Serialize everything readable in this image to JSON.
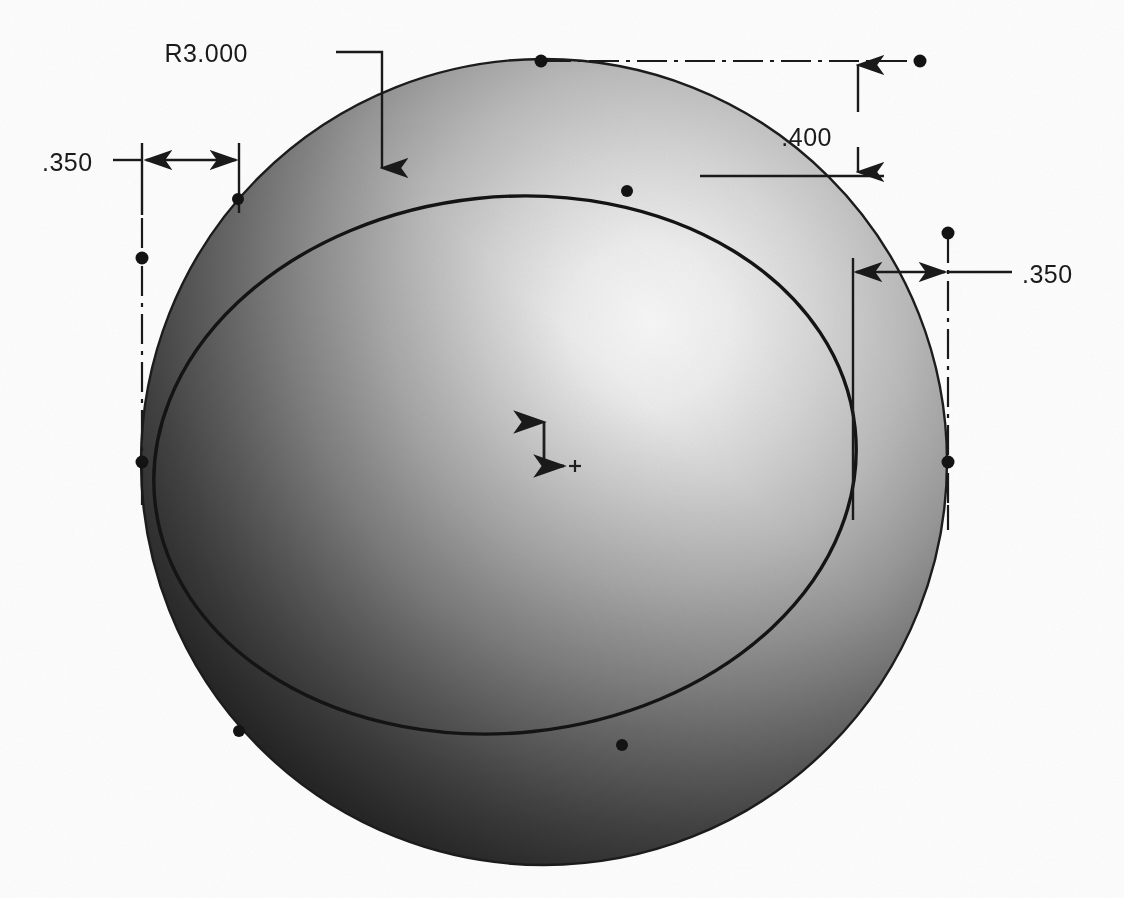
{
  "drawing": {
    "title": "Sphere with Revolved Cut - Dimensioned View",
    "type": "engineering-drawing",
    "background_color": "#fdfdfd",
    "line_color": "#1a1a1a",
    "canvas": {
      "width": 1124,
      "height": 898
    }
  },
  "sphere": {
    "name": "shaded-sphere",
    "center_x": 544,
    "center_y": 462,
    "radius": 403,
    "highlight_x_pct": 63,
    "highlight_y_pct": 33,
    "highlight_color": "#fbfbfb",
    "midtone_color": "#9a9a9a",
    "shadow_color": "#2a2a2a",
    "edge_color": "#222222"
  },
  "inner_curve": {
    "name": "revolved-cut-edge",
    "description": "offset circular edge of revolved cut",
    "center_x": 505,
    "center_y": 465,
    "radius": 352,
    "rotation_deg": -6
  },
  "dimensions": [
    {
      "id": "radius-callout",
      "name": "dimension-r3000",
      "label": "R3.000",
      "kind": "radius-leader",
      "text_x": 248,
      "text_y": 62,
      "leader_start_x": 336,
      "leader_elbow_x": 382,
      "leader_y": 52,
      "arrow_tip_x": 382,
      "arrow_tip_y": 176
    },
    {
      "id": "left-offset",
      "name": "dimension-left-350",
      "label": ".350",
      "value": 0.35,
      "kind": "linear-horizontal",
      "text_x": 42,
      "text_y": 170,
      "dim_line_y": 160,
      "ext_left_x": 142,
      "ext_right_x": 239,
      "ext_top_y": 143,
      "ext_bottom_y": 215,
      "leader_tail_x": 113
    },
    {
      "id": "top-offset",
      "name": "dimension-top-400",
      "label": ".400",
      "value": 0.4,
      "kind": "linear-vertical",
      "text_x": 832,
      "text_y": 137,
      "dim_line_x": 858,
      "ext_top_y": 61,
      "ext_bottom_y": 176,
      "upper_ref_y": 61,
      "lower_ref_y": 176
    },
    {
      "id": "right-offset",
      "name": "dimension-right-350",
      "label": ".350",
      "value": 0.35,
      "kind": "linear-horizontal",
      "text_x": 1022,
      "text_y": 290,
      "dim_line_y": 272,
      "ext_left_x": 853,
      "ext_right_x": 948,
      "ext_drop_y": 520,
      "leader_tail_x": 1012
    }
  ],
  "centerlines": [
    {
      "id": "cl-horizontal-top",
      "name": "centerline-horizontal-top",
      "orientation": "horizontal",
      "x1": 541,
      "x2": 920,
      "y": 61,
      "end_dot_x": 920
    },
    {
      "id": "cl-vertical-left",
      "name": "centerline-vertical-left",
      "orientation": "vertical",
      "x": 142,
      "y1": 218,
      "y2": 470,
      "end_dot_y": 258
    },
    {
      "id": "cl-vertical-right",
      "name": "centerline-vertical-right",
      "orientation": "vertical",
      "x": 948,
      "y1": 233,
      "y2": 500,
      "end_dot_y": 233
    }
  ],
  "vertex_points": [
    {
      "name": "vertex-sphere-top",
      "x": 541,
      "y": 61
    },
    {
      "name": "vertex-sphere-left",
      "x": 142,
      "y": 462
    },
    {
      "name": "vertex-sphere-right",
      "x": 948,
      "y": 462
    },
    {
      "name": "vertex-cut-top-left",
      "x": 238,
      "y": 199
    },
    {
      "name": "vertex-cut-top-right",
      "x": 627,
      "y": 191
    },
    {
      "name": "vertex-cut-bottom-left",
      "x": 239,
      "y": 731
    },
    {
      "name": "vertex-cut-bottom-right",
      "x": 622,
      "y": 745
    },
    {
      "name": "vertex-centerline-top-right",
      "x": 920,
      "y": 61
    },
    {
      "name": "vertex-centerline-left-top",
      "x": 142,
      "y": 258
    },
    {
      "name": "vertex-centerline-right-top",
      "x": 948,
      "y": 233
    }
  ],
  "origin_marker": {
    "name": "origin-triad",
    "x": 544,
    "y": 466,
    "y_axis_length": 56,
    "x_axis_length": 28,
    "label": ""
  }
}
